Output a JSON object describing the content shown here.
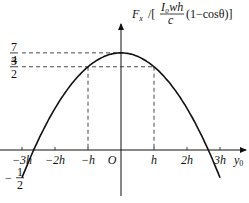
{
  "chart_data": {
    "type": "line",
    "title": "",
    "xlabel": "y₀",
    "ylabel": "F_x / [ I₀wh/c (1−cosθ) ]",
    "ylabel_parts": {
      "prefix": "F",
      "sub": "x",
      "frac_num": "I₀wh",
      "frac_den": "c",
      "suffix": "(1−cosθ)"
    },
    "origin_label": "O",
    "x_ticks": [
      "−3h",
      "−2h",
      "−h",
      "h",
      "2h",
      "3h"
    ],
    "x_tick_values": [
      -3,
      -2,
      -1,
      1,
      2,
      3
    ],
    "y_ticks": [
      {
        "value": 1.75,
        "num": "7",
        "den": "4",
        "sign": ""
      },
      {
        "value": 1.5,
        "num": "3",
        "den": "2",
        "sign": ""
      },
      {
        "value": -0.5,
        "num": "1",
        "den": "2",
        "sign": "−"
      }
    ],
    "series": [
      {
        "name": "F_x(y₀)",
        "formula": "7/4 − (y₀/h)²/4",
        "x": [
          -3,
          -2.646,
          -2,
          -1,
          0,
          1,
          2,
          2.646,
          3
        ],
        "values": [
          -0.5,
          0,
          0.75,
          1.5,
          1.75,
          1.5,
          0.75,
          0,
          -0.5
        ]
      }
    ],
    "annotations": [
      "dashed guide at F=7/4 to peak",
      "dashed guides at F=3/2 to y₀=±h"
    ],
    "xlim": [
      -3.5,
      3.6
    ],
    "ylim": [
      -0.75,
      2.5
    ],
    "grid": false,
    "legend": null
  }
}
